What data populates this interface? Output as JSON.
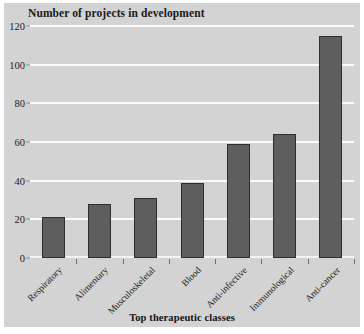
{
  "chart_data": {
    "type": "bar",
    "title": "Number of projects in development",
    "xlabel": "Top therapeutic classes",
    "ylabel": "",
    "categories": [
      "Respiratory",
      "Alimentary",
      "Musculoskeletal",
      "Blood",
      "Anti-infective",
      "Immunological",
      "Anti-cancer"
    ],
    "values": [
      21,
      28,
      31,
      39,
      59,
      64,
      115
    ],
    "ylim": [
      0,
      120
    ],
    "yticks": [
      0,
      20,
      40,
      60,
      80,
      100,
      120
    ],
    "ytick_labels": [
      "0",
      "20",
      "40",
      "60",
      "80",
      "100",
      "120"
    ],
    "grid": true,
    "legend": "none",
    "colors": {
      "bar_fill": "#5e5e5e",
      "bar_edge": "#2e2e2e",
      "panel_background": "#d3d3d3",
      "gridline": "#fbfbfb",
      "figure_background": "#ffffff",
      "text": "#1a1a1a"
    }
  }
}
